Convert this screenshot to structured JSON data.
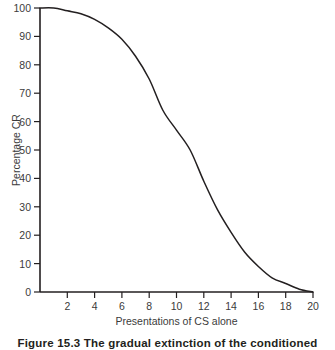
{
  "figure": {
    "caption": "Figure 15.3   The gradual extinction of the conditioned"
  },
  "chart_data": {
    "type": "line",
    "title": "",
    "xlabel": "Presentations of CS alone",
    "ylabel": "Percentage CR",
    "xlim": [
      0,
      20
    ],
    "ylim": [
      0,
      100
    ],
    "grid": false,
    "legend": "none",
    "xticks": [
      2,
      4,
      6,
      8,
      10,
      12,
      14,
      16,
      18,
      20
    ],
    "yticks": [
      0,
      10,
      20,
      30,
      40,
      50,
      60,
      70,
      80,
      90,
      100
    ],
    "line_color": "#231f20",
    "series": [
      {
        "name": "Percentage CR",
        "x": [
          0,
          1,
          2,
          3,
          4,
          5,
          6,
          7,
          8,
          9,
          10,
          11,
          12,
          13,
          14,
          15,
          16,
          17,
          18,
          19,
          20
        ],
        "values": [
          100,
          100,
          99,
          98,
          96,
          93,
          89,
          83,
          75,
          64,
          57,
          50,
          39,
          29,
          21,
          14,
          9,
          5,
          3,
          1,
          0
        ]
      }
    ]
  }
}
